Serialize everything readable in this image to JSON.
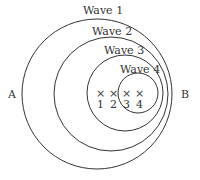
{
  "diagram": {
    "stroke_color": "#333333",
    "waves": [
      {
        "label": "Wave 1",
        "cx": 97,
        "cy": 94,
        "r": 75,
        "label_x": 83,
        "label_y": 14
      },
      {
        "label": "Wave 2",
        "cx": 111,
        "cy": 94,
        "r": 57,
        "label_x": 92,
        "label_y": 35
      },
      {
        "label": "Wave 3",
        "cx": 125,
        "cy": 93,
        "r": 38,
        "label_x": 104,
        "label_y": 54
      },
      {
        "label": "Wave 4",
        "cx": 138,
        "cy": 93,
        "r": 20,
        "label_x": 120,
        "label_y": 73
      }
    ],
    "points": [
      {
        "label": "1",
        "mark": "×",
        "x": 100,
        "y": 97
      },
      {
        "label": "2",
        "mark": "×",
        "x": 113,
        "y": 97
      },
      {
        "label": "3",
        "mark": "×",
        "x": 126,
        "y": 97
      },
      {
        "label": "4",
        "mark": "×",
        "x": 139,
        "y": 97
      }
    ],
    "side_labels": {
      "left": "A",
      "right": "B"
    }
  }
}
